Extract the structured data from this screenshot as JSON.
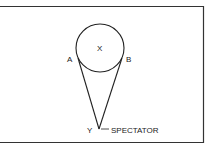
{
  "diagram": {
    "labels": {
      "center": "X",
      "left_tangent": "A",
      "right_tangent": "B",
      "vertex": "Y",
      "vertex_note": "SPECTATOR"
    },
    "colors": {
      "stroke": "#222222",
      "background": "#ffffff"
    }
  }
}
